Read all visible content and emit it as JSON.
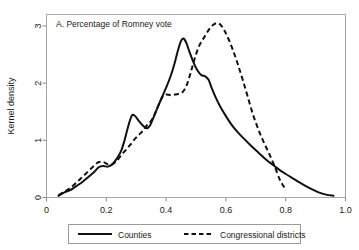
{
  "chart_data": {
    "type": "line",
    "title": "A. Percentage of Romney vote",
    "xlabel": "",
    "ylabel": "Kernel density",
    "xlim": [
      0,
      1.0
    ],
    "ylim": [
      0,
      3.2
    ],
    "grid": false,
    "legend_position": "bottom-outside",
    "xticks": [
      "0",
      "0.2",
      "0.4",
      "0.6",
      "0.8",
      "1.0"
    ],
    "xtick_values": [
      0,
      0.2,
      0.4,
      0.6,
      0.8,
      1.0
    ],
    "yticks": [
      "0",
      "1",
      "2",
      "3"
    ],
    "ytick_values": [
      0,
      1,
      2,
      3
    ],
    "series": [
      {
        "name": "Counties",
        "style": "solid",
        "color": "#111111",
        "points": [
          [
            0.04,
            0.03
          ],
          [
            0.06,
            0.09
          ],
          [
            0.08,
            0.13
          ],
          [
            0.1,
            0.2
          ],
          [
            0.12,
            0.27
          ],
          [
            0.14,
            0.36
          ],
          [
            0.16,
            0.45
          ],
          [
            0.175,
            0.53
          ],
          [
            0.19,
            0.55
          ],
          [
            0.205,
            0.54
          ],
          [
            0.22,
            0.58
          ],
          [
            0.235,
            0.68
          ],
          [
            0.25,
            0.82
          ],
          [
            0.262,
            1.02
          ],
          [
            0.272,
            1.22
          ],
          [
            0.285,
            1.43
          ],
          [
            0.297,
            1.42
          ],
          [
            0.31,
            1.33
          ],
          [
            0.322,
            1.26
          ],
          [
            0.335,
            1.21
          ],
          [
            0.345,
            1.25
          ],
          [
            0.358,
            1.4
          ],
          [
            0.372,
            1.58
          ],
          [
            0.385,
            1.74
          ],
          [
            0.4,
            1.92
          ],
          [
            0.415,
            2.12
          ],
          [
            0.428,
            2.34
          ],
          [
            0.44,
            2.58
          ],
          [
            0.45,
            2.74
          ],
          [
            0.458,
            2.78
          ],
          [
            0.468,
            2.7
          ],
          [
            0.48,
            2.52
          ],
          [
            0.492,
            2.36
          ],
          [
            0.505,
            2.22
          ],
          [
            0.518,
            2.14
          ],
          [
            0.53,
            2.12
          ],
          [
            0.542,
            2.06
          ],
          [
            0.552,
            1.92
          ],
          [
            0.565,
            1.76
          ],
          [
            0.58,
            1.6
          ],
          [
            0.598,
            1.44
          ],
          [
            0.618,
            1.28
          ],
          [
            0.64,
            1.14
          ],
          [
            0.662,
            1.02
          ],
          [
            0.685,
            0.9
          ],
          [
            0.71,
            0.78
          ],
          [
            0.735,
            0.66
          ],
          [
            0.76,
            0.56
          ],
          [
            0.785,
            0.46
          ],
          [
            0.81,
            0.38
          ],
          [
            0.835,
            0.3
          ],
          [
            0.86,
            0.22
          ],
          [
            0.885,
            0.15
          ],
          [
            0.91,
            0.09
          ],
          [
            0.935,
            0.05
          ],
          [
            0.96,
            0.03
          ]
        ]
      },
      {
        "name": "Congressional districts",
        "style": "dashed",
        "color": "#111111",
        "points": [
          [
            0.04,
            0.04
          ],
          [
            0.06,
            0.1
          ],
          [
            0.08,
            0.17
          ],
          [
            0.1,
            0.26
          ],
          [
            0.12,
            0.36
          ],
          [
            0.14,
            0.46
          ],
          [
            0.16,
            0.56
          ],
          [
            0.175,
            0.62
          ],
          [
            0.19,
            0.62
          ],
          [
            0.205,
            0.58
          ],
          [
            0.22,
            0.58
          ],
          [
            0.235,
            0.64
          ],
          [
            0.25,
            0.74
          ],
          [
            0.265,
            0.83
          ],
          [
            0.28,
            0.92
          ],
          [
            0.295,
            1.02
          ],
          [
            0.31,
            1.1
          ],
          [
            0.325,
            1.18
          ],
          [
            0.338,
            1.28
          ],
          [
            0.35,
            1.34
          ],
          [
            0.362,
            1.46
          ],
          [
            0.375,
            1.62
          ],
          [
            0.388,
            1.76
          ],
          [
            0.4,
            1.8
          ],
          [
            0.415,
            1.79
          ],
          [
            0.43,
            1.8
          ],
          [
            0.445,
            1.82
          ],
          [
            0.458,
            1.86
          ],
          [
            0.47,
            1.98
          ],
          [
            0.482,
            2.18
          ],
          [
            0.495,
            2.42
          ],
          [
            0.508,
            2.62
          ],
          [
            0.52,
            2.74
          ],
          [
            0.532,
            2.84
          ],
          [
            0.545,
            2.95
          ],
          [
            0.558,
            3.02
          ],
          [
            0.57,
            3.05
          ],
          [
            0.582,
            3.02
          ],
          [
            0.595,
            2.92
          ],
          [
            0.608,
            2.78
          ],
          [
            0.622,
            2.6
          ],
          [
            0.638,
            2.36
          ],
          [
            0.655,
            2.08
          ],
          [
            0.672,
            1.78
          ],
          [
            0.69,
            1.46
          ],
          [
            0.708,
            1.2
          ],
          [
            0.722,
            1.02
          ],
          [
            0.738,
            0.84
          ],
          [
            0.752,
            0.68
          ],
          [
            0.765,
            0.52
          ],
          [
            0.778,
            0.34
          ],
          [
            0.79,
            0.22
          ],
          [
            0.8,
            0.15
          ]
        ]
      }
    ]
  },
  "legend": {
    "entries": [
      {
        "label": "Counties",
        "style": "solid"
      },
      {
        "label": "Congressional districts",
        "style": "dashed"
      }
    ]
  }
}
